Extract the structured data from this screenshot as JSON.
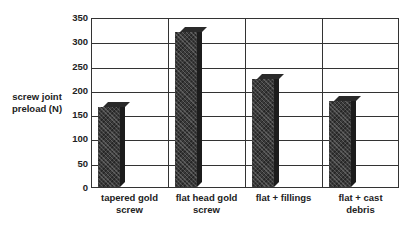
{
  "chart_data": {
    "type": "bar",
    "title": "",
    "xlabel": "",
    "ylabel": "screw joint preload (N)",
    "categories": [
      "tapered gold screw",
      "flat head gold screw",
      "flat + fillings",
      "flat + cast debris"
    ],
    "category_lines": [
      [
        "tapered gold",
        "screw"
      ],
      [
        "flat head gold",
        "screw"
      ],
      [
        "flat + fillings"
      ],
      [
        "flat + cast",
        "debris"
      ]
    ],
    "values": [
      165,
      320,
      222,
      178
    ],
    "ylim": [
      0,
      350
    ],
    "yticks": [
      "0",
      "50",
      "100",
      "150",
      "200",
      "250",
      "300",
      "350"
    ],
    "grid": true,
    "legend": null,
    "style": "3d-bar"
  }
}
